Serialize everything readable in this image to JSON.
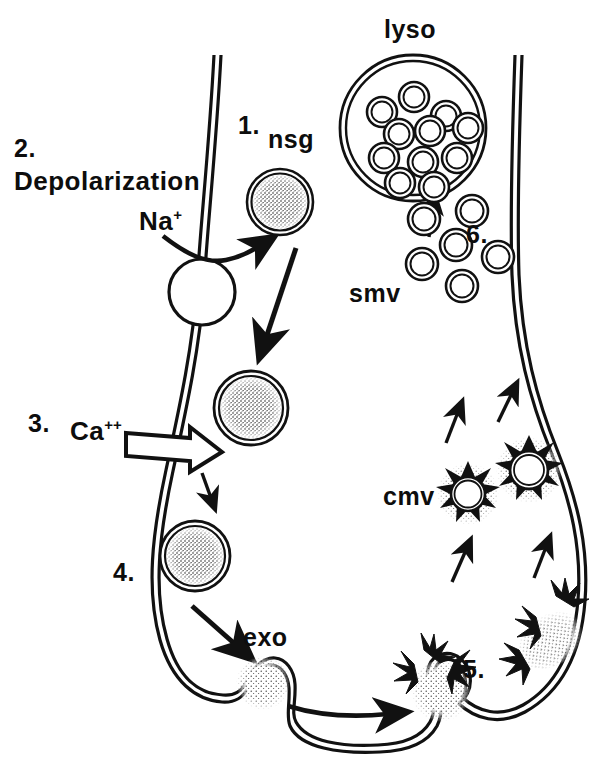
{
  "figure": {
    "ink_color": "#111111",
    "background": "#ffffff"
  },
  "labels": {
    "step1": "1.",
    "nsg": "nsg",
    "step2": "2.",
    "depolarization": "Depolarization",
    "na": "Na",
    "na_charge": "+",
    "step3": "3.",
    "ca": "Ca",
    "ca_charge": "++",
    "step4": "4.",
    "exo": "exo",
    "step5": "5.",
    "step6": "6.",
    "smv": "smv",
    "cmv": "cmv",
    "lyso": "lyso"
  },
  "structures": {
    "lysosome": {
      "name": "lyso",
      "center": [
        413,
        128
      ],
      "radius": 73,
      "inner_vesicle_count": 11,
      "inner_vesicles": [
        [
          382,
          114
        ],
        [
          413,
          99
        ],
        [
          443,
          117
        ],
        [
          398,
          133
        ],
        [
          428,
          131
        ],
        [
          466,
          128
        ],
        [
          385,
          156
        ],
        [
          422,
          160
        ],
        [
          457,
          157
        ],
        [
          399,
          182
        ],
        [
          434,
          186
        ]
      ],
      "inner_vesicle_radius": 15
    },
    "nsg_granules": [
      {
        "center": [
          280,
          202
        ],
        "radius": 33,
        "stage": "1-transport"
      },
      {
        "center": [
          251,
          408
        ],
        "radius": 36,
        "stage": "3-approach"
      },
      {
        "center": [
          195,
          556
        ],
        "radius": 34,
        "stage": "4-docked"
      }
    ],
    "exocytosis_omega": {
      "center": [
        263,
        683
      ],
      "radius": 24
    },
    "smooth_microvesicles": {
      "label": "smv",
      "count": 6,
      "positions": [
        [
          424,
          219
        ],
        [
          472,
          211
        ],
        [
          456,
          245
        ],
        [
          422,
          264
        ],
        [
          498,
          257
        ],
        [
          462,
          286
        ]
      ],
      "radius": 16
    },
    "coated_microvesicles": {
      "label": "cmv",
      "count": 2,
      "positions": [
        [
          468,
          494
        ],
        [
          529,
          470
        ]
      ],
      "radius": 19
    },
    "coated_pit": {
      "center": [
        432,
        654
      ],
      "label": "5."
    },
    "ion_channel": {
      "center": [
        202,
        292
      ],
      "radius": 33
    }
  },
  "arrows": [
    {
      "name": "na-influx-arrow",
      "from": [
        168,
        240
      ],
      "to": [
        252,
        250
      ]
    },
    {
      "name": "nsg-transport-arrow",
      "from": [
        295,
        250
      ],
      "to": [
        268,
        342
      ]
    },
    {
      "name": "ca-influx-hollow-arrow",
      "from": [
        128,
        442
      ],
      "to": [
        215,
        455
      ]
    },
    {
      "name": "granule-descent-arrow",
      "from": [
        203,
        475
      ],
      "to": [
        212,
        503
      ]
    },
    {
      "name": "docking-arrow",
      "from": [
        196,
        608
      ],
      "to": [
        240,
        648
      ]
    },
    {
      "name": "membrane-flow-arrow",
      "from": [
        290,
        708
      ],
      "to": [
        395,
        714
      ]
    },
    {
      "name": "recycle-arrow-a",
      "from": [
        455,
        580
      ],
      "to": [
        467,
        549
      ]
    },
    {
      "name": "recycle-arrow-b",
      "from": [
        536,
        575
      ],
      "to": [
        546,
        545
      ]
    },
    {
      "name": "recycle-arrow-c",
      "from": [
        449,
        442
      ],
      "to": [
        459,
        410
      ]
    },
    {
      "name": "recycle-arrow-d",
      "from": [
        500,
        420
      ],
      "to": [
        513,
        392
      ]
    },
    {
      "name": "lyso-uptake-arrow",
      "from": [
        430,
        235
      ],
      "to": [
        434,
        202
      ]
    }
  ]
}
